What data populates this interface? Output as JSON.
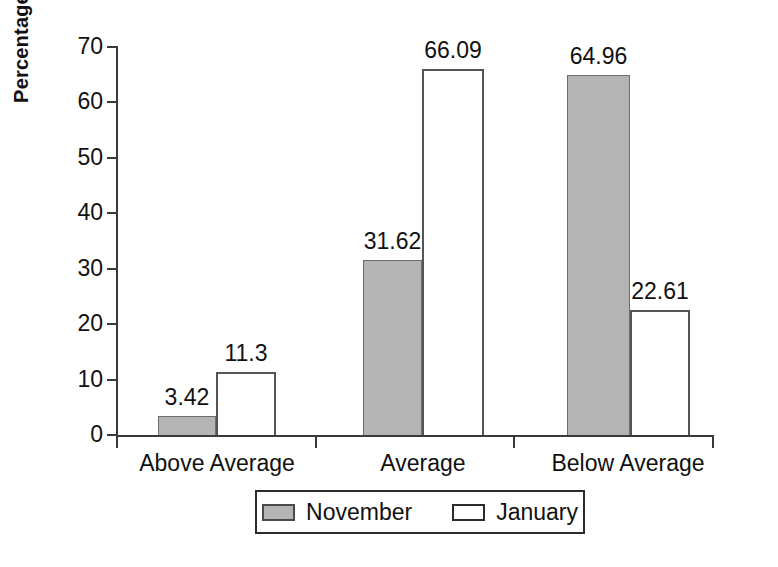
{
  "chart_data": {
    "type": "bar",
    "title": "",
    "subtitle": "",
    "xlabel": "",
    "ylabel": "Percentage of Students",
    "categories": [
      "Above Average",
      "Average",
      "Below Average"
    ],
    "series": [
      {
        "name": "November",
        "color": "#b4b4b4",
        "values": [
          3.42,
          31.62,
          64.96
        ],
        "labels": [
          "3.42",
          "31.62",
          "64.96"
        ]
      },
      {
        "name": "January",
        "color": "#ffffff",
        "values": [
          11.3,
          66.09,
          22.61
        ],
        "labels": [
          "11.3",
          "66.09",
          "22.61"
        ]
      }
    ],
    "ylim": [
      0,
      70
    ],
    "ytick_labels": [
      "0",
      "10",
      "20",
      "30",
      "40",
      "50",
      "60",
      "70"
    ],
    "ytick_values": [
      0,
      10,
      20,
      30,
      40,
      50,
      60,
      70
    ],
    "grid": false,
    "legend_position": "bottom",
    "legend_entries": [
      "November",
      "January"
    ],
    "axis_color": "#3a3a3a",
    "bar_border_color": "#555555",
    "text_color": "#111111"
  }
}
